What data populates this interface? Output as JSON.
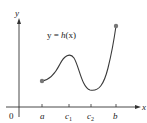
{
  "diagram": {
    "type": "function-graph",
    "function_label": {
      "prefix": "y = ",
      "name": "h",
      "args": "(x)"
    },
    "axes": {
      "x_label": "x",
      "y_label": "y",
      "origin_label": "0"
    },
    "ticks": [
      {
        "label": "a",
        "sub": ""
      },
      {
        "label": "c",
        "sub": "1"
      },
      {
        "label": "c",
        "sub": "2"
      },
      {
        "label": "b",
        "sub": ""
      }
    ],
    "curve_color": "#3a3a3a",
    "endpoint_color": "#777777",
    "axis_color": "#333333"
  }
}
